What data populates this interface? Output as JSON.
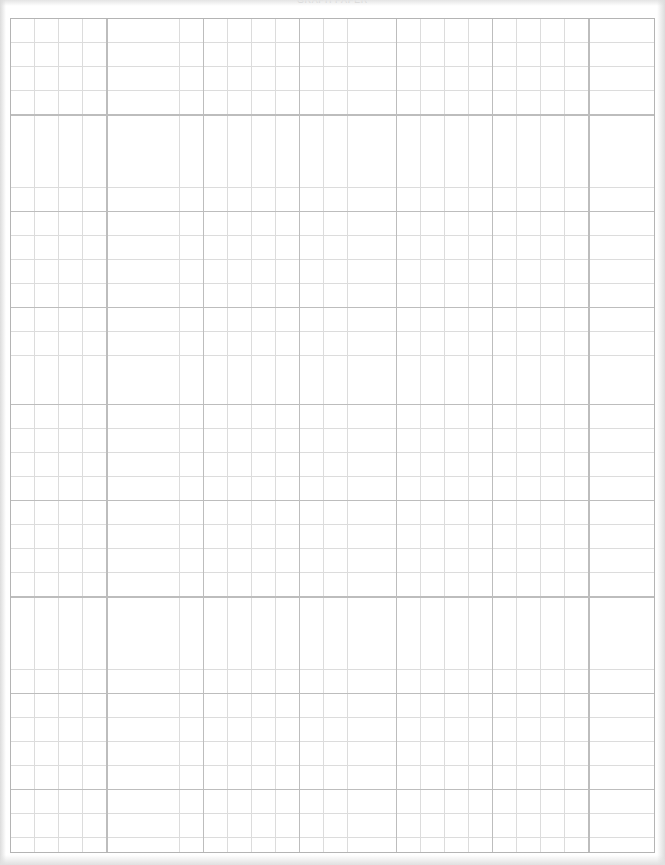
{
  "page": {
    "kind": "graph-paper-sheet",
    "header_text": "GRAPH PAPER",
    "background_color": "#e8e8e8",
    "sheet_color": "#ffffff",
    "width_px": 665,
    "height_px": 865
  },
  "grid": {
    "origin_x_px": 10,
    "origin_y_px": 18,
    "width_px": 645,
    "height_px": 835,
    "minor_cell_px": 24.1,
    "major_every_n_cells": 4,
    "major_block_px": 96.4,
    "minor_line_color": "#dcdcdc",
    "major_line_color": "#bdbdbd",
    "border_line_color": "#b4b4b4",
    "minor_columns": 27,
    "minor_rows": 35,
    "major_columns": 7,
    "major_rows": 9
  },
  "chart_data": {
    "type": "table",
    "title": "GRAPH PAPER",
    "xlabel": "",
    "ylabel": "",
    "categories": [],
    "values": [],
    "grid": true,
    "legend": "none"
  }
}
